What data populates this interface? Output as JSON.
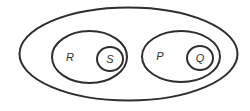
{
  "diagram": {
    "type": "nested-sets",
    "stroke_color": "#2e2e2e",
    "background": "#ffffff",
    "sets": [
      {
        "id": "universe",
        "label": "",
        "contains": [
          "R",
          "P"
        ]
      },
      {
        "id": "R",
        "label": "R",
        "contains": [
          "S"
        ]
      },
      {
        "id": "S",
        "label": "S",
        "contains": []
      },
      {
        "id": "P",
        "label": "P",
        "contains": [
          "Q"
        ]
      },
      {
        "id": "Q",
        "label": "Q",
        "contains": []
      }
    ],
    "labels": {
      "R": "R",
      "S": "S",
      "P": "P",
      "Q": "Q"
    }
  }
}
